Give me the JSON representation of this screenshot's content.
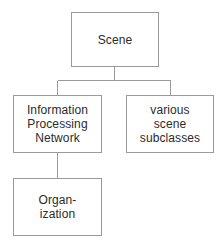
{
  "diagram": {
    "background_color": "#ffffff",
    "border_color": "#9a9a9a",
    "text_color": "#2b2b2b",
    "nodes": [
      {
        "id": "scene",
        "label": "Scene"
      },
      {
        "id": "information-processing-network",
        "label": "Information\nProcessing\nNetwork"
      },
      {
        "id": "various-scene-subclasses",
        "label": "various\nscene\nsubclasses"
      },
      {
        "id": "organization",
        "label": "Organ-\nization"
      }
    ],
    "edges": [
      {
        "from": "scene",
        "to": "information-processing-network"
      },
      {
        "from": "scene",
        "to": "various-scene-subclasses"
      },
      {
        "from": "information-processing-network",
        "to": "organization"
      }
    ]
  }
}
